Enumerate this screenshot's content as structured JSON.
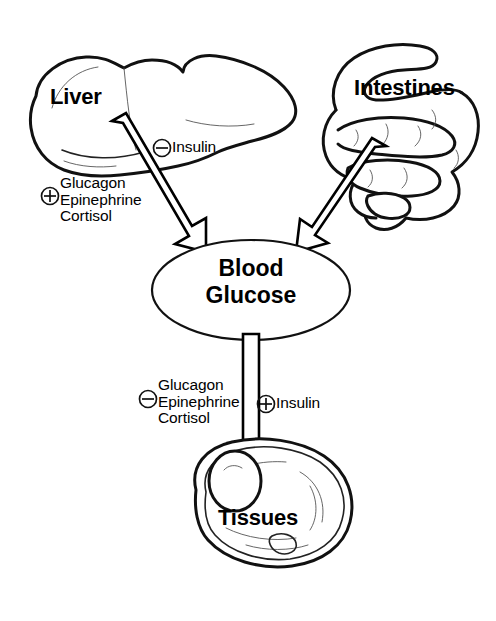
{
  "diagram": {
    "background_color": "#ffffff",
    "stroke_color": "#111111",
    "nodes": {
      "liver": {
        "label": "Liver",
        "icon": "liver-organ-icon"
      },
      "intestines": {
        "label": "Intestines",
        "icon": "intestines-organ-icon"
      },
      "blood_glucose": {
        "label_line1": "Blood",
        "label_line2": "Glucose",
        "label": "Blood Glucose",
        "shape": "ellipse"
      },
      "tissues": {
        "label": "Tissues",
        "icon": "cell-tissue-icon"
      }
    },
    "edges": [
      {
        "from": "liver",
        "to": "blood_glucose",
        "style": "hollow-block-arrow",
        "direction": "down-right"
      },
      {
        "from": "intestines",
        "to": "blood_glucose",
        "style": "hollow-block-arrow",
        "direction": "down-left"
      },
      {
        "from": "blood_glucose",
        "to": "tissues",
        "style": "hollow-block-arrow",
        "direction": "down"
      }
    ],
    "annotations": {
      "liver_positive": {
        "sign": "plus",
        "sign_glyph": "+",
        "hormones": [
          "Glucagon",
          "Epinephrine",
          "Cortisol"
        ],
        "line1": "Glucagon",
        "line2": "Epinephrine",
        "line3": "Cortisol"
      },
      "liver_negative": {
        "sign": "minus",
        "sign_glyph": "−",
        "hormone": "Insulin"
      },
      "tissues_negative": {
        "sign": "minus",
        "sign_glyph": "−",
        "hormones": [
          "Glucagon",
          "Epinephrine",
          "Cortisol"
        ],
        "line1": "Glucagon",
        "line2": "Epinephrine",
        "line3": "Cortisol"
      },
      "tissues_positive": {
        "sign": "plus",
        "sign_glyph": "+",
        "hormone": "Insulin"
      }
    }
  }
}
